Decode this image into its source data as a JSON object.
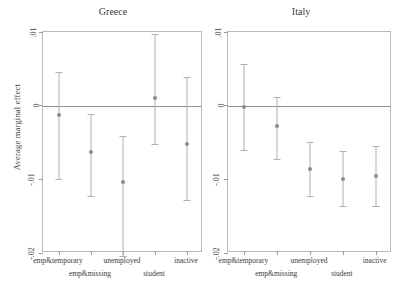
{
  "chart_data": {
    "type": "scatter",
    "title": "",
    "ylabel": "Average marginal effect",
    "xlabel": "",
    "ylim": [
      -0.02,
      0.01
    ],
    "yticks": [
      0.01,
      0,
      -0.01,
      -0.02
    ],
    "ytick_labels": [
      ".01",
      "0",
      "-.01",
      "-.02"
    ],
    "grid": false,
    "legend": false,
    "zero_reference_line": true,
    "categories": [
      "emp&temporary",
      "emp&missing",
      "unemployed",
      "student",
      "inactive"
    ],
    "panels": [
      {
        "name": "Greece",
        "series": [
          {
            "name": "Average marginal effect",
            "values": [
              -0.0013,
              -0.0063,
              -0.0103,
              0.001,
              -0.0052
            ],
            "ci_low": [
              -0.0099,
              -0.0122,
              -0.0204,
              -0.0052,
              -0.0128
            ],
            "ci_high": [
              0.0046,
              -0.0011,
              -0.0041,
              0.0097,
              0.0039
            ]
          }
        ]
      },
      {
        "name": "Italy",
        "series": [
          {
            "name": "Average marginal effect",
            "values": [
              -0.0002,
              -0.0028,
              -0.0086,
              -0.0099,
              -0.0095
            ],
            "ci_low": [
              -0.006,
              -0.0073,
              -0.0122,
              -0.0136,
              -0.0136
            ],
            "ci_high": [
              0.0056,
              0.0012,
              -0.0049,
              -0.0062,
              -0.0055
            ]
          }
        ]
      }
    ]
  },
  "axis": {
    "ylabel": "Average marginal effect",
    "ytick_labels": [
      ".01",
      "0",
      "-.01",
      "-.02"
    ]
  },
  "panels": {
    "greece": {
      "title": "Greece"
    },
    "italy": {
      "title": "Italy"
    }
  },
  "xlabels": {
    "row1": [
      "emp&temporary",
      "unemployed",
      "inactive"
    ],
    "row2": [
      "emp&missing",
      "student"
    ]
  }
}
